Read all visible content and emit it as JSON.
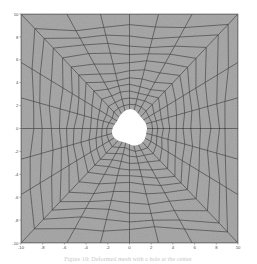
{
  "figure": {
    "title": "",
    "caption": "Figure 10: Deformed mesh with a hole at the center"
  },
  "chart_data": {
    "type": "line",
    "title": "",
    "xlabel": "",
    "ylabel": "",
    "xlim": [
      -10,
      10
    ],
    "ylim": [
      -10,
      10
    ],
    "grid": false,
    "legend": false,
    "legend_position": "none",
    "plot_background_color": "#a2a2a2",
    "mesh_line_color": "#3a3a3a",
    "hole_fill_color": "#ffffff",
    "axis_color": "#6b6b6b",
    "page_background_color": "#ffffff",
    "xticks": [
      -10,
      -8,
      -6,
      -4,
      -2,
      0,
      2,
      4,
      6,
      8,
      10
    ],
    "xticklabels": [
      "-10",
      "-8",
      "-6",
      "-4",
      "-2",
      "0",
      "2",
      "4",
      "6",
      "8",
      "10"
    ],
    "yticks": [
      -10,
      -8,
      -6,
      -4,
      -2,
      0,
      2,
      4,
      6,
      8,
      10
    ],
    "yticklabels": [
      "-10",
      "-8",
      "-6",
      "-4",
      "-2",
      "0",
      "2",
      "4",
      "6",
      "8",
      "10"
    ],
    "n_radial_lines": 24,
    "n_rings": 13,
    "hole_radius_mean": 1.55,
    "hole_radius_values": [
      1.62,
      1.58,
      1.5,
      1.44,
      1.55,
      1.68,
      1.72,
      1.6,
      1.48,
      1.38,
      1.3,
      1.42,
      1.58,
      1.7,
      1.64,
      1.5,
      1.36,
      1.28,
      1.4,
      1.56,
      1.66,
      1.72,
      1.68,
      1.6
    ],
    "ring_fractions": [
      0.0,
      0.055,
      0.115,
      0.18,
      0.25,
      0.325,
      0.405,
      0.49,
      0.58,
      0.675,
      0.775,
      0.87,
      1.0
    ],
    "radial_spoke_angles_deg": [
      0,
      15,
      30,
      45,
      60,
      75,
      90,
      105,
      120,
      135,
      150,
      165,
      180,
      195,
      210,
      225,
      240,
      255,
      270,
      285,
      300,
      315,
      330,
      345
    ],
    "outer_boundary": "square",
    "square_half_width": 10
  }
}
